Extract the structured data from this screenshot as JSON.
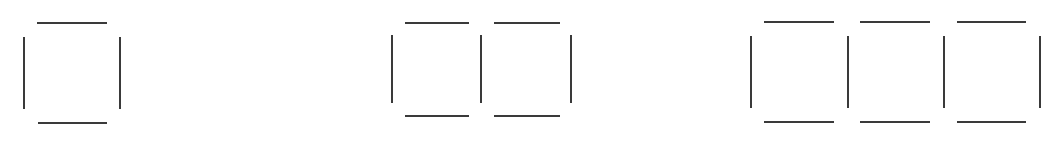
{
  "diagram": {
    "title": "",
    "stroke_color": "#3a3a3a",
    "background": "#ffffff",
    "figures": [
      {
        "name": "one-square",
        "squares": 1,
        "horizontal": [
          {
            "x1": 37,
            "x2": 107,
            "y": 23
          },
          {
            "x1": 38,
            "x2": 107,
            "y": 123
          }
        ],
        "vertical": [
          {
            "x": 24,
            "y1": 37,
            "y2": 109
          },
          {
            "x": 120,
            "y1": 37,
            "y2": 109
          }
        ]
      },
      {
        "name": "two-squares",
        "squares": 2,
        "horizontal": [
          {
            "x1": 405,
            "x2": 469,
            "y": 23
          },
          {
            "x1": 494,
            "x2": 560,
            "y": 23
          },
          {
            "x1": 405,
            "x2": 469,
            "y": 116
          },
          {
            "x1": 494,
            "x2": 560,
            "y": 116
          }
        ],
        "vertical": [
          {
            "x": 392,
            "y1": 35,
            "y2": 103
          },
          {
            "x": 481,
            "y1": 35,
            "y2": 103
          },
          {
            "x": 571,
            "y1": 35,
            "y2": 103
          }
        ]
      },
      {
        "name": "three-squares",
        "squares": 3,
        "horizontal": [
          {
            "x1": 764,
            "x2": 834,
            "y": 22
          },
          {
            "x1": 860,
            "x2": 930,
            "y": 22
          },
          {
            "x1": 957,
            "x2": 1026,
            "y": 22
          },
          {
            "x1": 764,
            "x2": 834,
            "y": 122
          },
          {
            "x1": 860,
            "x2": 930,
            "y": 122
          },
          {
            "x1": 957,
            "x2": 1026,
            "y": 122
          }
        ],
        "vertical": [
          {
            "x": 751,
            "y1": 36,
            "y2": 108
          },
          {
            "x": 848,
            "y1": 36,
            "y2": 108
          },
          {
            "x": 944,
            "y1": 36,
            "y2": 108
          },
          {
            "x": 1040,
            "y1": 36,
            "y2": 108
          }
        ]
      }
    ]
  }
}
